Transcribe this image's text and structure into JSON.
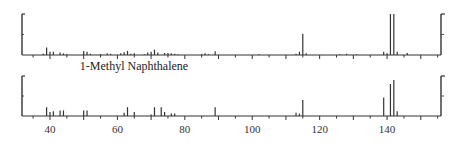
{
  "chart_data": [
    {
      "type": "bar",
      "title": "",
      "panel": "top (reference spectrum)",
      "xlabel": "m/z",
      "ylabel": "Relative abundance",
      "xlim": [
        31.7,
        156
      ],
      "ylim": [
        0,
        100
      ],
      "grid": false,
      "x": [
        38,
        39,
        40,
        41,
        43,
        44,
        45,
        50,
        51,
        52,
        55,
        57,
        58,
        61,
        62,
        63,
        64,
        65,
        68,
        69,
        70,
        71,
        72,
        74,
        75,
        76,
        77,
        78,
        85,
        86,
        87,
        89,
        102,
        113,
        114,
        115,
        116,
        126,
        128,
        131,
        139,
        140,
        141,
        142,
        143,
        146
      ],
      "values": [
        3,
        18,
        8,
        8,
        6,
        4,
        2,
        10,
        8,
        3,
        2,
        4,
        3,
        4,
        7,
        10,
        3,
        4,
        2,
        6,
        8,
        13,
        6,
        5,
        5,
        4,
        3,
        2,
        2,
        4,
        2,
        9,
        2,
        3,
        8,
        52,
        4,
        2,
        3,
        2,
        8,
        4,
        100,
        100,
        8,
        5
      ]
    },
    {
      "type": "bar",
      "title": "1-Methyl Naphthalene",
      "panel": "bottom (sample spectrum)",
      "xlabel": "m/z",
      "ylabel": "Relative abundance",
      "xlim": [
        31.7,
        156
      ],
      "ylim": [
        0,
        100
      ],
      "grid": false,
      "x": [
        39,
        40,
        41,
        43,
        44,
        50,
        51,
        62,
        63,
        65,
        70,
        71,
        73,
        74,
        76,
        77,
        89,
        113,
        114,
        115,
        139,
        141,
        142,
        143
      ],
      "values": [
        22,
        10,
        12,
        14,
        14,
        14,
        14,
        8,
        22,
        10,
        4,
        22,
        22,
        10,
        6,
        6,
        22,
        8,
        6,
        40,
        46,
        80,
        90,
        12
      ],
      "xticks": [
        40,
        60,
        80,
        100,
        120,
        140
      ]
    }
  ],
  "labels": {
    "compound_name": "1-Methyl Naphthalene",
    "xticks": [
      "40",
      "60",
      "80",
      "100",
      "120",
      "140"
    ]
  },
  "colors": {
    "axis": "#333333",
    "peak": "#333333",
    "text": "#222222"
  }
}
